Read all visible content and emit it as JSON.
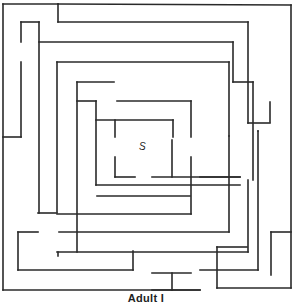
{
  "caption": "Adult I",
  "start_label": "S",
  "colors": {
    "wall": "#2a2a2a",
    "background": "#ffffff"
  },
  "maze": {
    "stroke_width": 1.6,
    "walls": [
      [
        3,
        4,
        58,
        4
      ],
      [
        58,
        4,
        58,
        22
      ],
      [
        58,
        4,
        291,
        5
      ],
      [
        291,
        5,
        291,
        288
      ],
      [
        3,
        4,
        3,
        290
      ],
      [
        3,
        290,
        200,
        290
      ],
      [
        217,
        288,
        291,
        288
      ],
      [
        217,
        247,
        217,
        288
      ],
      [
        217,
        247,
        247,
        247
      ],
      [
        58,
        22,
        248,
        22
      ],
      [
        248,
        22,
        248,
        123
      ],
      [
        21,
        22,
        39,
        22
      ],
      [
        21,
        22,
        21,
        42
      ],
      [
        21,
        62,
        21,
        137
      ],
      [
        3,
        137,
        21,
        137
      ],
      [
        39,
        22,
        39,
        213
      ],
      [
        39,
        42,
        233,
        42
      ],
      [
        233,
        42,
        233,
        82
      ],
      [
        233,
        82,
        253,
        82
      ],
      [
        253,
        82,
        253,
        180
      ],
      [
        57,
        62,
        229,
        62
      ],
      [
        229,
        62,
        229,
        136
      ],
      [
        57,
        62,
        57,
        212
      ],
      [
        77,
        82,
        114,
        82
      ],
      [
        77,
        82,
        77,
        252
      ],
      [
        77,
        101,
        96,
        101
      ],
      [
        96,
        101,
        96,
        185
      ],
      [
        117,
        101,
        191,
        101
      ],
      [
        191,
        101,
        191,
        137
      ],
      [
        96,
        120,
        173,
        120
      ],
      [
        173,
        120,
        173,
        137
      ],
      [
        115,
        120,
        115,
        137
      ],
      [
        115,
        157,
        115,
        177
      ],
      [
        115,
        177,
        135,
        177
      ],
      [
        152,
        177,
        240,
        177
      ],
      [
        172,
        140,
        172,
        177
      ],
      [
        191,
        157,
        191,
        214
      ],
      [
        200,
        177,
        240,
        177
      ],
      [
        96,
        185,
        240,
        185
      ],
      [
        97,
        196,
        190,
        196
      ],
      [
        57,
        214,
        191,
        214
      ],
      [
        57,
        252,
        248,
        252
      ],
      [
        248,
        180,
        248,
        252
      ],
      [
        38,
        213,
        57,
        213
      ],
      [
        18,
        232,
        38,
        232
      ],
      [
        18,
        232,
        18,
        270
      ],
      [
        18,
        270,
        133,
        270
      ],
      [
        133,
        251,
        133,
        270
      ],
      [
        59,
        232,
        229,
        232
      ],
      [
        229,
        136,
        229,
        232
      ],
      [
        58,
        252,
        58,
        256
      ],
      [
        152,
        273,
        191,
        273
      ],
      [
        172,
        273,
        172,
        290
      ],
      [
        152,
        290,
        200,
        290
      ],
      [
        200,
        270,
        258,
        270
      ],
      [
        258,
        131,
        258,
        270
      ],
      [
        271,
        232,
        271,
        275
      ],
      [
        271,
        232,
        291,
        232
      ],
      [
        270,
        102,
        270,
        122
      ],
      [
        248,
        123,
        270,
        123
      ],
      [
        258,
        131,
        258,
        131
      ]
    ]
  }
}
